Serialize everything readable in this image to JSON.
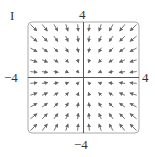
{
  "panel_label": "I",
  "axis_labels": {
    "top": "4",
    "bottom": "−4",
    "left": "−4",
    "right": "4"
  },
  "colors": {
    "frame": "#aaaaaa",
    "axes": "#555555",
    "arrows": "#666666"
  },
  "chart_data": {
    "type": "vector_field",
    "title": "I",
    "xlim": [
      -4,
      4
    ],
    "ylim": [
      -4,
      4
    ],
    "xlabel": "",
    "ylabel": "",
    "tick_labels": {
      "x": [
        "-4",
        "4"
      ],
      "y": [
        "-4",
        "4"
      ]
    },
    "grid": false,
    "grid_points": 10,
    "field": "F(x,y) = -(x, y)"
  }
}
